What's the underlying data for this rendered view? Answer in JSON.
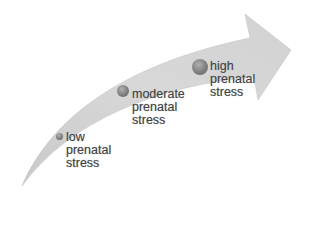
{
  "diagram": {
    "type": "progression-arrow",
    "colors": {
      "arrow": "#d4d4d4",
      "arrow_edge": "#bdbdbd",
      "dot": "#7a7a7a",
      "text": "#444444"
    },
    "stages": [
      {
        "id": "low",
        "line1": "low",
        "line2": "prenatal",
        "line3": "stress"
      },
      {
        "id": "moderate",
        "line1": "moderate",
        "line2": "prenatal",
        "line3": "stress"
      },
      {
        "id": "high",
        "line1": "high",
        "line2": "prenatal",
        "line3": "stress"
      }
    ]
  }
}
